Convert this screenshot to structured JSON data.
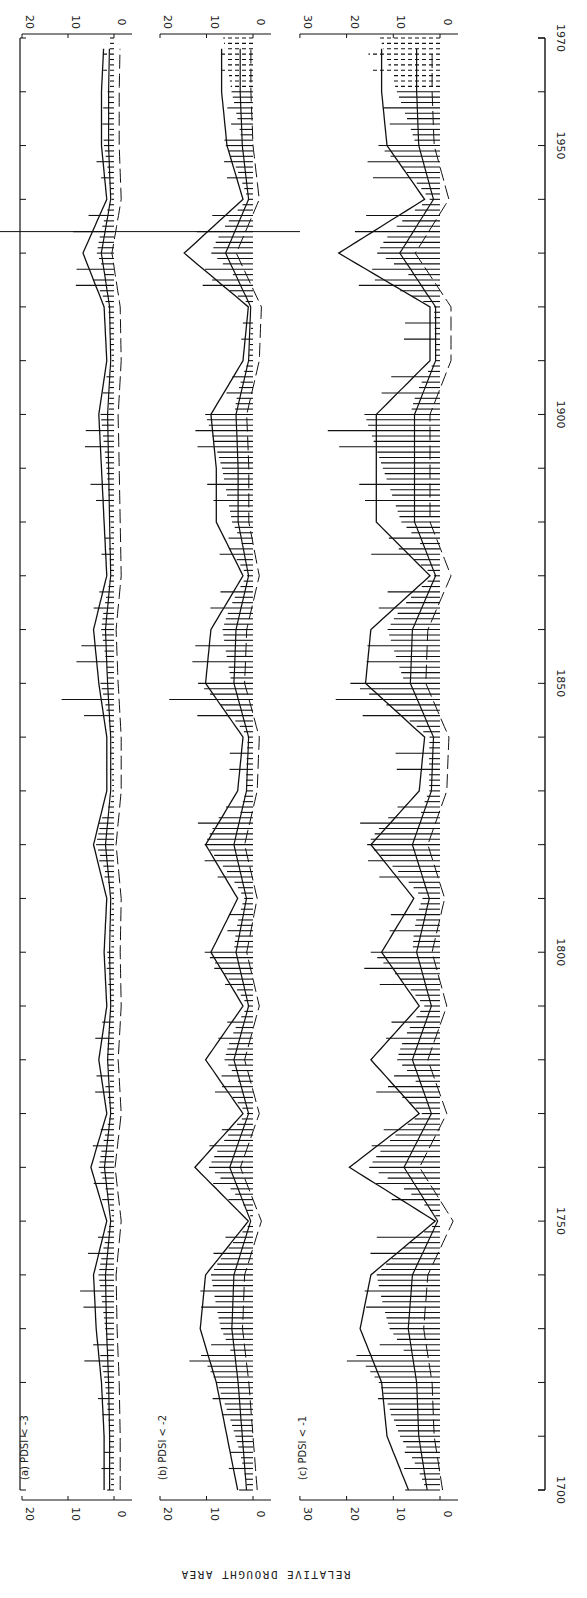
{
  "figure": {
    "y_axis_title": "RELATIVE DROUGHT AREA",
    "time_axis": {
      "start": 1700,
      "end": 1970,
      "major_labels": [
        "1700",
        "1750",
        "1800",
        "1850",
        "1900",
        "1950",
        "1970"
      ],
      "minor_step": 10
    },
    "panels": [
      {
        "id": "a",
        "label": "(a)",
        "title": "PDSI < -3",
        "ticks": [
          "20",
          "10",
          "0"
        ]
      },
      {
        "id": "b",
        "label": "(b)",
        "title": "PDSI < -2",
        "ticks": [
          "20",
          "10",
          "0"
        ]
      },
      {
        "id": "c",
        "label": "(c)",
        "title": "PDSI < -1",
        "ticks": [
          "30",
          "20",
          "10",
          "0"
        ]
      }
    ]
  },
  "chart_data": [
    {
      "type": "bar",
      "title": "(a) PDSI < -3",
      "xlabel": "Year",
      "ylabel": "Relative drought area",
      "ylim": [
        0,
        20
      ],
      "note": "Annual bars (values estimated per decade mid-points) with smoothed solid curve and dashed low-pass curve; plot is rotated 90 degrees",
      "x": [
        1700,
        1710,
        1720,
        1730,
        1740,
        1750,
        1760,
        1770,
        1780,
        1790,
        1800,
        1810,
        1820,
        1830,
        1840,
        1850,
        1860,
        1870,
        1880,
        1890,
        1900,
        1910,
        1920,
        1930,
        1940,
        1950,
        1960,
        1970
      ],
      "series": [
        {
          "name": "annual max bar",
          "values": [
            6,
            2,
            5,
            9,
            10,
            1,
            9,
            1,
            9,
            1,
            2,
            1,
            5,
            1,
            1,
            17,
            8,
            2,
            4,
            8,
            6,
            1,
            1,
            20,
            2,
            5,
            3,
            3
          ]
        },
        {
          "name": "smoothed",
          "values": [
            1,
            1,
            1.5,
            2.5,
            3,
            0.5,
            3.5,
            0.5,
            2,
            0.5,
            1,
            0.5,
            3,
            0.5,
            0.5,
            2,
            3,
            0.5,
            1,
            1.5,
            2,
            0.5,
            1,
            5,
            0.5,
            1.5,
            1.5,
            1
          ]
        }
      ]
    },
    {
      "type": "bar",
      "title": "(b) PDSI < -2",
      "xlabel": "Year",
      "ylabel": "Relative drought area",
      "ylim": [
        0,
        20
      ],
      "x": [
        1700,
        1710,
        1720,
        1730,
        1740,
        1750,
        1760,
        1770,
        1780,
        1790,
        1800,
        1810,
        1820,
        1830,
        1840,
        1850,
        1860,
        1870,
        1880,
        1890,
        1900,
        1910,
        1920,
        1930,
        1940,
        1950,
        1960,
        1970
      ],
      "series": [
        {
          "name": "annual max bar",
          "values": [
            10,
            6,
            12,
            17,
            14,
            3,
            17,
            4,
            15,
            4,
            11,
            6,
            15,
            8,
            6,
            25,
            16,
            5,
            11,
            14,
            13,
            4,
            2,
            25,
            6,
            7,
            9,
            8
          ]
        },
        {
          "name": "smoothed",
          "values": [
            2,
            4,
            6,
            9,
            8,
            0,
            10,
            1,
            8,
            1,
            7,
            2,
            8,
            2,
            1,
            8,
            7,
            1,
            6,
            6,
            7,
            1,
            0,
            12,
            1,
            4,
            5,
            5
          ]
        }
      ]
    },
    {
      "type": "bar",
      "title": "(c) PDSI < -1",
      "xlabel": "Year",
      "ylabel": "Relative drought area",
      "ylim": [
        0,
        30
      ],
      "x": [
        1700,
        1710,
        1720,
        1730,
        1740,
        1750,
        1760,
        1770,
        1780,
        1790,
        1800,
        1810,
        1820,
        1830,
        1840,
        1850,
        1860,
        1870,
        1880,
        1890,
        1900,
        1910,
        1920,
        1930,
        1940,
        1950,
        1960,
        1970
      ],
      "series": [
        {
          "name": "annual max bar",
          "values": [
            14,
            10,
            18,
            24,
            20,
            12,
            24,
            10,
            20,
            11,
            20,
            14,
            20,
            14,
            12,
            29,
            21,
            10,
            23,
            23,
            27,
            11,
            8,
            33,
            16,
            17,
            19,
            18
          ]
        },
        {
          "name": "smoothed",
          "values": [
            5,
            9,
            10,
            14,
            12,
            0,
            16,
            3,
            12,
            3,
            10,
            4,
            12,
            3,
            2,
            13,
            12,
            1,
            11,
            11,
            11,
            1,
            1,
            18,
            2,
            9,
            10,
            10
          ]
        }
      ]
    }
  ]
}
